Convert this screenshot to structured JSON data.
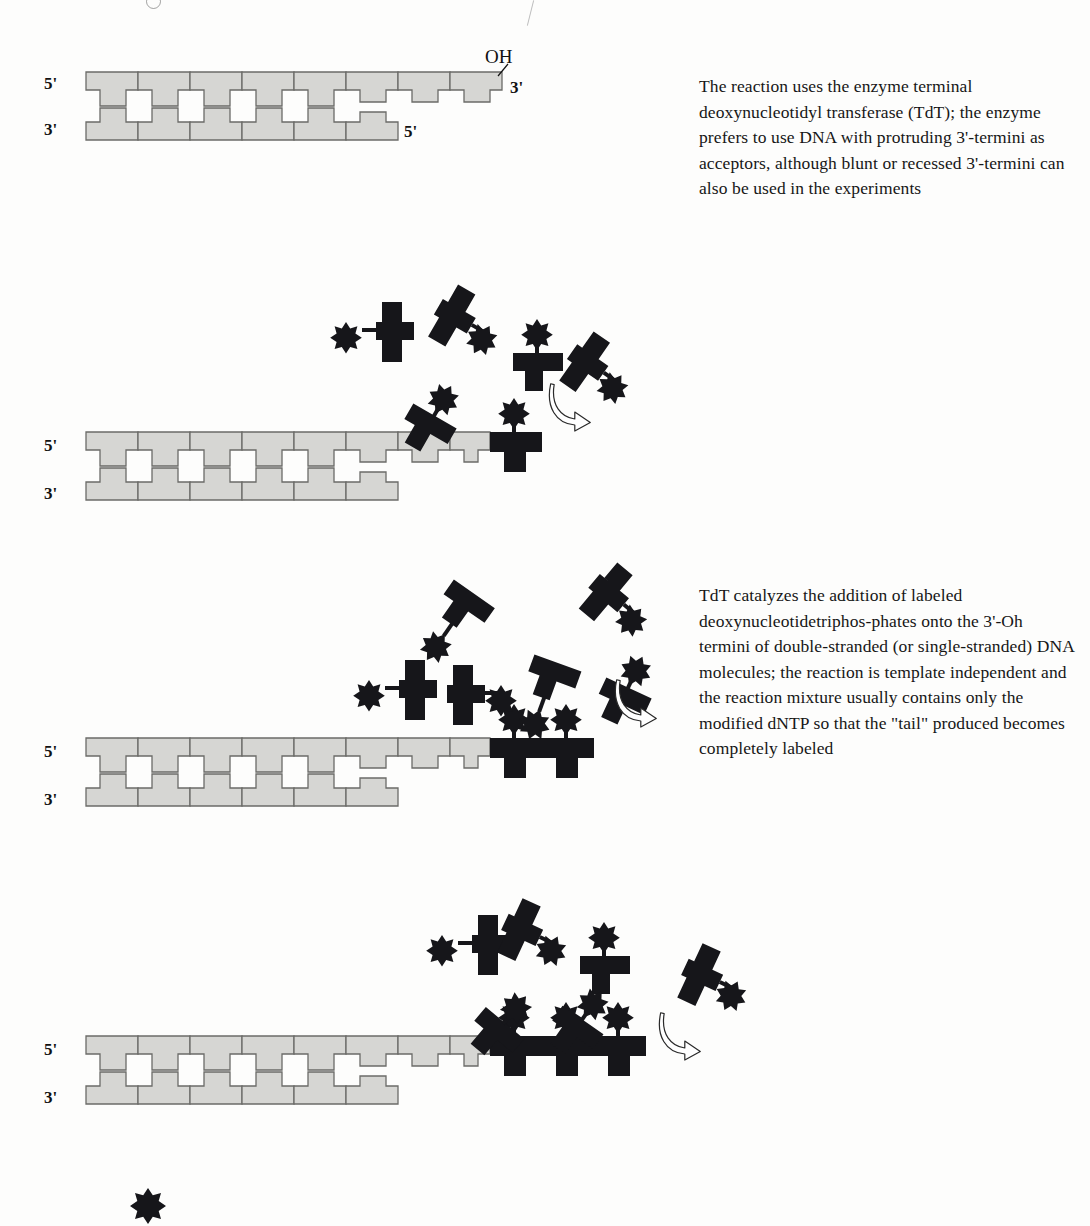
{
  "figure": {
    "type": "biology-process-diagram",
    "background_color": "#fdfdfc",
    "dna_color": "#d6d6d3",
    "dna_stroke": "#6b6b68",
    "label_color": "#111111"
  },
  "captions": {
    "first": "The reaction uses the enzyme terminal deoxynucleotidyl transferase (TdT); the enzyme prefers to use DNA with protruding 3'-termini as acceptors, although blunt or recessed 3'-termini can also be used in the experiments",
    "second": "TdT catalyzes the addition of labeled deoxynucleotidetriphos-phates onto the 3'-Oh termini of double-stranded (or single-stranded) DNA molecules; the reaction is template independent and the reaction mixture usually contains only the modified dNTP so that the \"tail\" produced becomes completely labeled"
  },
  "labels": {
    "five_prime": "5'",
    "three_prime": "3'",
    "hydroxyl": "OH"
  },
  "panels": [
    {
      "id": "panel-1",
      "name": "starting-duplex",
      "left_top_label": "5'",
      "left_bottom_label": "3'",
      "right_top_label": "3'",
      "right_bottom_label": "5'",
      "hydroxyl_label": "OH",
      "paired_bases": 5,
      "overhang_nucleotides": 3,
      "labeled_nucleotides_added": 0,
      "free_nucleotides": 0,
      "has_arrow": false
    },
    {
      "id": "panel-2",
      "name": "first-nucleotide-added",
      "left_top_label": "5'",
      "left_bottom_label": "3'",
      "paired_bases": 5,
      "overhang_nucleotides": 3,
      "labeled_nucleotides_added": 1,
      "free_nucleotides": 5,
      "has_arrow": true
    },
    {
      "id": "panel-3",
      "name": "second-nucleotide-added",
      "left_top_label": "5'",
      "left_bottom_label": "3'",
      "paired_bases": 5,
      "overhang_nucleotides": 3,
      "labeled_nucleotides_added": 2,
      "free_nucleotides": 6,
      "has_arrow": true
    },
    {
      "id": "panel-4",
      "name": "third-nucleotide-added",
      "left_top_label": "5'",
      "left_bottom_label": "3'",
      "paired_bases": 5,
      "overhang_nucleotides": 3,
      "labeled_nucleotides_added": 3,
      "free_nucleotides": 6,
      "has_arrow": true
    }
  ],
  "free_nucleotide_positions": {
    "panel_2": [
      {
        "x": 332,
        "y": 292,
        "rot": 0,
        "star": "left"
      },
      {
        "x": 424,
        "y": 288,
        "rot": 30,
        "star": "right"
      },
      {
        "x": 503,
        "y": 305,
        "rot": 0,
        "star": "top"
      },
      {
        "x": 556,
        "y": 336,
        "rot": 35,
        "star": "right"
      },
      {
        "x": 400,
        "y": 368,
        "rot": 30,
        "star": "top"
      }
    ],
    "panel_3": [
      {
        "x": 421,
        "y": 572,
        "rot": 35,
        "star": "bottom"
      },
      {
        "x": 576,
        "y": 568,
        "rot": 40,
        "star": "right"
      },
      {
        "x": 355,
        "y": 650,
        "rot": 0,
        "star": "left"
      },
      {
        "x": 437,
        "y": 655,
        "rot": 0,
        "star": "right"
      },
      {
        "x": 512,
        "y": 645,
        "rot": 20,
        "star": "bottom"
      },
      {
        "x": 594,
        "y": 640,
        "rot": 25,
        "star": "top"
      }
    ],
    "panel_4": [
      {
        "x": 428,
        "y": 905,
        "rot": 0,
        "star": "left"
      },
      {
        "x": 492,
        "y": 900,
        "rot": 25,
        "star": "right"
      },
      {
        "x": 570,
        "y": 908,
        "rot": 0,
        "star": "top"
      },
      {
        "x": 672,
        "y": 945,
        "rot": 25,
        "star": "right"
      },
      {
        "x": 470,
        "y": 975,
        "rot": 40,
        "star": "top"
      },
      {
        "x": 548,
        "y": 972,
        "rot": 35,
        "star": "top"
      }
    ]
  },
  "arrows": [
    {
      "id": "arrow-1",
      "x": 547,
      "y": 382
    },
    {
      "id": "arrow-2",
      "x": 613,
      "y": 678
    },
    {
      "id": "arrow-3",
      "x": 657,
      "y": 1011
    }
  ],
  "legend": {
    "marker": "asterisk",
    "note": "labeled (modified) nucleotide marker"
  }
}
